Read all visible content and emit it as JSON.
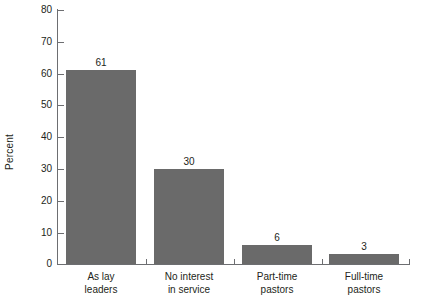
{
  "chart_data": {
    "type": "bar",
    "title": "",
    "subtitle": "",
    "xlabel": "",
    "ylabel": "Percent",
    "categories": [
      "As lay leaders",
      "No interest in service",
      "Part-time pastors",
      "Full-time pastors"
    ],
    "category_lines": [
      [
        "As lay",
        "leaders"
      ],
      [
        "No interest",
        "in service"
      ],
      [
        "Part-time",
        "pastors"
      ],
      [
        "Full-time",
        "pastors"
      ]
    ],
    "values": [
      61,
      30,
      6,
      3
    ],
    "value_labels": [
      "61",
      "30",
      "6",
      "3"
    ],
    "ylim": [
      0,
      80
    ],
    "yticks": [
      0,
      10,
      20,
      30,
      40,
      50,
      60,
      70,
      80
    ],
    "ytick_labels": [
      "0",
      "10",
      "20",
      "30",
      "40",
      "50",
      "60",
      "70",
      "80"
    ],
    "grid": false,
    "legend": null,
    "colors": {
      "bar_fill": "#6a6a6a",
      "axis": "#6d6e71",
      "text": "#231f20",
      "background": "#ffffff"
    }
  }
}
